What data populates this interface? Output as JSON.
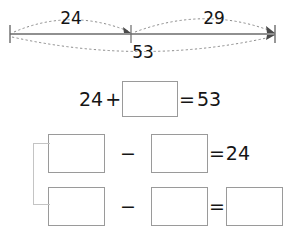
{
  "worksheet": {
    "title": "Number line bar model with fact family equations"
  },
  "numberline": {
    "left_label": "24",
    "right_label": "29",
    "total_label": "53",
    "left_tick_x": 10,
    "mid_tick_x": 131,
    "right_tick_x": 275,
    "baseline_y": 34
  },
  "equations": [
    {
      "id": "equation-1",
      "parts": [
        {
          "kind": "number",
          "text": "24"
        },
        {
          "kind": "operator",
          "text": "+"
        },
        {
          "kind": "blank",
          "text": ""
        },
        {
          "kind": "operator",
          "text": "="
        },
        {
          "kind": "number",
          "text": "53"
        }
      ]
    },
    {
      "id": "equation-2",
      "parts": [
        {
          "kind": "blank",
          "text": ""
        },
        {
          "kind": "operator",
          "text": "−"
        },
        {
          "kind": "blank",
          "text": ""
        },
        {
          "kind": "operator",
          "text": "="
        },
        {
          "kind": "number",
          "text": "24"
        }
      ]
    },
    {
      "id": "equation-3",
      "parts": [
        {
          "kind": "blank",
          "text": ""
        },
        {
          "kind": "operator",
          "text": "−"
        },
        {
          "kind": "blank",
          "text": ""
        },
        {
          "kind": "operator",
          "text": "="
        },
        {
          "kind": "blank",
          "text": ""
        }
      ]
    }
  ],
  "equation_1": {
    "operand_a": "24",
    "operator_1": "+",
    "blank_1": "",
    "equals": "=",
    "result": "53"
  },
  "equation_2": {
    "blank_1": "",
    "operator_1": "−",
    "blank_2": "",
    "equals": "=",
    "result": "24"
  },
  "equation_3": {
    "blank_1": "",
    "operator_1": "−",
    "blank_2": "",
    "equals": "=",
    "blank_3": ""
  },
  "colors": {
    "ink": "#151515",
    "box_border": "#9a9a9a",
    "bracket_border": "#c4c4c4",
    "line": "#6b6b6b",
    "dotted_arc": "#8c8c8c",
    "background": "#ffffff"
  }
}
